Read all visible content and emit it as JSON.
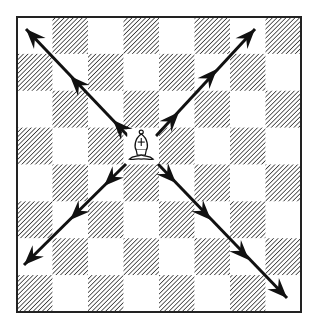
{
  "diagram": {
    "board": {
      "files": 8,
      "ranks": 8,
      "left": 17,
      "top": 17,
      "width": 284,
      "height": 295,
      "top_left_square": "light",
      "light_color": "#ffffff",
      "dark_pattern": "diagonal-hatch",
      "hatch_color": "#333333",
      "border_color": "#222222"
    },
    "piece": {
      "type": "bishop",
      "color": "white",
      "glyph": "♗",
      "file_index": 3,
      "rank_index_from_top": 3
    },
    "arrows": [
      {
        "direction": "up-left",
        "from": [
          128,
          136
        ],
        "to": [
          26,
          29
        ],
        "heads": [
          [
            113,
            120
          ],
          [
            70,
            76
          ],
          [
            26,
            29
          ]
        ]
      },
      {
        "direction": "up-right",
        "from": [
          156,
          136
        ],
        "to": [
          255,
          29
        ],
        "heads": [
          [
            179,
            112
          ],
          [
            217,
            69
          ],
          [
            255,
            29
          ]
        ]
      },
      {
        "direction": "down-left",
        "from": [
          126,
          164
        ],
        "to": [
          24,
          265
        ],
        "heads": [
          [
            104,
            186
          ],
          [
            70,
            220
          ],
          [
            24,
            265
          ]
        ]
      },
      {
        "direction": "down-right",
        "from": [
          158,
          164
        ],
        "to": [
          287,
          298
        ],
        "heads": [
          [
            176,
            183
          ],
          [
            211,
            220
          ],
          [
            249,
            260
          ],
          [
            287,
            298
          ]
        ]
      }
    ],
    "arrow_color": "#111111"
  }
}
